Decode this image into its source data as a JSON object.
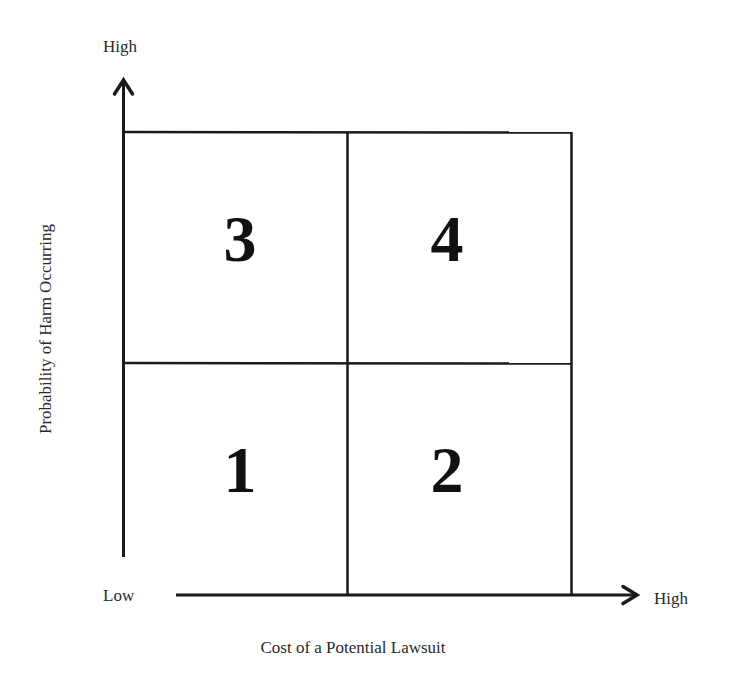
{
  "diagram": {
    "type": "2x2 risk matrix",
    "y_axis": {
      "title": "Probability of Harm Occurring",
      "high_label": "High",
      "low_label": "Low"
    },
    "x_axis": {
      "title": "Cost of a Potential Lawsuit",
      "high_label": "High"
    },
    "quadrants": {
      "top_left": "3",
      "top_right": "4",
      "bottom_left": "1",
      "bottom_right": "2"
    },
    "colors": {
      "line": "#1a1a1a",
      "background": "#ffffff",
      "text": "#2a2a2a"
    }
  }
}
